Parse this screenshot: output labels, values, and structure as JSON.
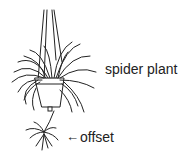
{
  "diagram": {
    "labels": {
      "plant": "spider plant",
      "offset": "offset"
    },
    "arrow_glyph": "←",
    "colors": {
      "line": "#222222",
      "background": "#ffffff"
    }
  }
}
